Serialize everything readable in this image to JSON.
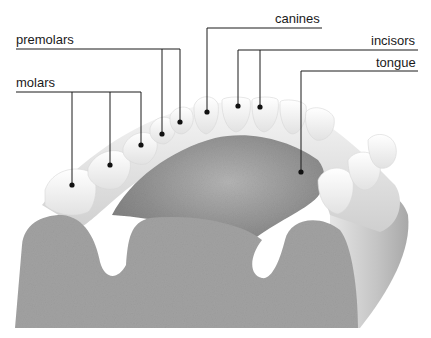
{
  "diagram": {
    "labels": [
      {
        "id": "premolars",
        "text": "premolars"
      },
      {
        "id": "molars",
        "text": "molars"
      },
      {
        "id": "canines",
        "text": "canines"
      },
      {
        "id": "incisors",
        "text": "incisors"
      },
      {
        "id": "tongue",
        "text": "tongue"
      }
    ],
    "colors": {
      "leader_line": "#1a1a1a",
      "tooth": "#f4f4f4",
      "gum": "#d8d8d8",
      "tongue": "#9a9a9a",
      "bone_section": "#9c9c9c",
      "background": "#ffffff"
    }
  }
}
